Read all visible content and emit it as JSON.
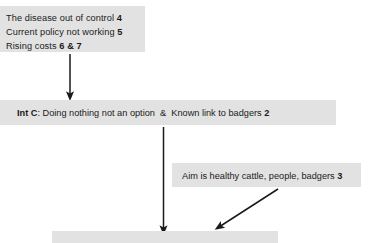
{
  "diagram": {
    "background_color": "#ffffff",
    "box_fill_color": "#e2e2e2",
    "text_color": "#1a1a1a",
    "arrow_color": "#1a1a1a",
    "nodes": {
      "problems": {
        "lines": [
          {
            "text": "The disease out of control ",
            "ref": "4"
          },
          {
            "text": "Current policy not working ",
            "ref": "5"
          },
          {
            "text": "Rising costs ",
            "ref": "6 & 7"
          }
        ]
      },
      "int_c": {
        "label": "Int C",
        "separator": ": ",
        "text_a": "Doing nothing not an option",
        "conjunction": "&",
        "text_b": "Known link to badgers ",
        "ref": "2"
      },
      "aim": {
        "text": "Aim is healthy cattle, people, badgers ",
        "ref": "3"
      },
      "outcome": {
        "text": ""
      }
    },
    "arrows": [
      {
        "name": "problems-to-intc",
        "kind": "vertical"
      },
      {
        "name": "intc-to-outcome",
        "kind": "vertical"
      },
      {
        "name": "aim-to-outcome",
        "kind": "diagonal"
      }
    ]
  }
}
